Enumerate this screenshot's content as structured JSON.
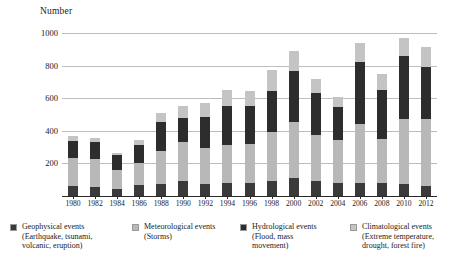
{
  "chart_data": {
    "type": "bar",
    "subtype": "stacked-bar",
    "title": "",
    "xlabel": "",
    "ylabel": "Number",
    "ylim": [
      0,
      1000
    ],
    "yticks": [
      200,
      400,
      600,
      800,
      1000
    ],
    "grid": true,
    "legend_position": "bottom",
    "categories": [
      "1980",
      "1981",
      "1982",
      "1983",
      "1984",
      "1985",
      "1986",
      "1987",
      "1988",
      "1989",
      "1990",
      "1991",
      "1992",
      "1993",
      "1994",
      "1995",
      "1996",
      "1997",
      "1998",
      "1999",
      "2000",
      "2001",
      "2002",
      "2003",
      "2004",
      "2005",
      "2006",
      "2007",
      "2008",
      "2009",
      "2010",
      "2011",
      "2012"
    ],
    "xtick_labels": [
      "1980",
      "1982",
      "1984",
      "1986",
      "1988",
      "1990",
      "1992",
      "1994",
      "1996",
      "1998",
      "2000",
      "2002",
      "2004",
      "2006",
      "2008",
      "2010",
      "2012"
    ],
    "series": [
      {
        "name": "Geophysical events",
        "sublabel": "(Earthquake, tsunami, volcanic, eruption)",
        "color": "#3a3a3a",
        "values": [
          60,
          55,
          58,
          50,
          42,
          55,
          68,
          60,
          72,
          70,
          95,
          78,
          72,
          70,
          78,
          82,
          82,
          80,
          90,
          88,
          110,
          95,
          90,
          88,
          82,
          80,
          80,
          78,
          78,
          76,
          76,
          74,
          62
        ]
      },
      {
        "name": "Meteorological events",
        "sublabel": "(Storms)",
        "color": "#b8b8b8",
        "values": [
          175,
          180,
          172,
          150,
          118,
          150,
          135,
          175,
          205,
          210,
          235,
          230,
          220,
          230,
          235,
          240,
          240,
          235,
          300,
          285,
          345,
          330,
          285,
          275,
          260,
          290,
          360,
          330,
          270,
          305,
          395,
          380,
          410
        ]
      },
      {
        "name": "Hydrological events",
        "sublabel": "(Flood, mass movement)",
        "color": "#2d2d2d",
        "values": [
          100,
          95,
          100,
          80,
          90,
          95,
          110,
          110,
          180,
          175,
          150,
          175,
          195,
          200,
          240,
          195,
          230,
          215,
          255,
          265,
          310,
          280,
          260,
          230,
          205,
          195,
          385,
          320,
          305,
          300,
          390,
          370,
          320
        ]
      },
      {
        "name": "Climatological events",
        "sublabel": "(Extreme temperature, drought, forest fire)",
        "color": "#c4c4c4",
        "values": [
          35,
          30,
          25,
          40,
          15,
          30,
          30,
          32,
          55,
          60,
          75,
          80,
          85,
          90,
          100,
          80,
          90,
          80,
          130,
          120,
          125,
          105,
          85,
          80,
          60,
          70,
          115,
          90,
          95,
          70,
          110,
          105,
          120
        ]
      }
    ],
    "plotted_categories": [
      "1980",
      "1982",
      "1984",
      "1986",
      "1988",
      "1990",
      "1992",
      "1994",
      "1996",
      "1998",
      "2000",
      "2002",
      "2004",
      "2006",
      "2008",
      "2010",
      "2012"
    ],
    "plotted_stacks": [
      {
        "category": "1980",
        "geophysical": 60,
        "meteorological": 175,
        "hydrological": 100,
        "climatological": 35,
        "total": 370
      },
      {
        "category": "1982",
        "geophysical": 58,
        "meteorological": 172,
        "hydrological": 100,
        "climatological": 25,
        "total": 355
      },
      {
        "category": "1984",
        "geophysical": 42,
        "meteorological": 118,
        "hydrological": 90,
        "climatological": 15,
        "total": 265
      },
      {
        "category": "1986",
        "geophysical": 68,
        "meteorological": 135,
        "hydrological": 110,
        "climatological": 30,
        "total": 343
      },
      {
        "category": "1988",
        "geophysical": 72,
        "meteorological": 205,
        "hydrological": 180,
        "climatological": 55,
        "total": 512
      },
      {
        "category": "1990",
        "geophysical": 95,
        "meteorological": 235,
        "hydrological": 150,
        "climatological": 75,
        "total": 555
      },
      {
        "category": "1992",
        "geophysical": 72,
        "meteorological": 220,
        "hydrological": 195,
        "climatological": 85,
        "total": 572
      },
      {
        "category": "1994",
        "geophysical": 78,
        "meteorological": 235,
        "hydrological": 240,
        "climatological": 100,
        "total": 653
      },
      {
        "category": "1996",
        "geophysical": 82,
        "meteorological": 240,
        "hydrological": 230,
        "climatological": 90,
        "total": 642
      },
      {
        "category": "1998",
        "geophysical": 90,
        "meteorological": 300,
        "hydrological": 255,
        "climatological": 130,
        "total": 775
      },
      {
        "category": "2000",
        "geophysical": 110,
        "meteorological": 345,
        "hydrological": 310,
        "climatological": 125,
        "total": 890
      },
      {
        "category": "2002",
        "geophysical": 90,
        "meteorological": 285,
        "hydrological": 260,
        "climatological": 85,
        "total": 720
      },
      {
        "category": "2004",
        "geophysical": 82,
        "meteorological": 260,
        "hydrological": 205,
        "climatological": 60,
        "total": 607
      },
      {
        "category": "2006",
        "geophysical": 80,
        "meteorological": 360,
        "hydrological": 385,
        "climatological": 115,
        "total": 940
      },
      {
        "category": "2008",
        "geophysical": 78,
        "meteorological": 270,
        "hydrological": 305,
        "climatological": 95,
        "total": 748
      },
      {
        "category": "2010",
        "geophysical": 76,
        "meteorological": 395,
        "hydrological": 390,
        "climatological": 110,
        "total": 971
      },
      {
        "category": "2012",
        "geophysical": 62,
        "meteorological": 410,
        "hydrological": 320,
        "climatological": 120,
        "total": 912
      }
    ]
  },
  "legend": {
    "items": [
      {
        "label": "Geophysical events\n(Earthquake, tsunami,\nvolcanic, eruption)",
        "color": "#3a3a3a"
      },
      {
        "label": "Meteorological events\n(Storms)",
        "color": "#b8b8b8"
      },
      {
        "label": "Hydrological events\n(Flood, mass\nmovement)",
        "color": "#2d2d2d"
      },
      {
        "label": "Climatological events\n(Extreme temperature,\ndrought, forest fire)",
        "color": "#c4c4c4"
      }
    ]
  }
}
